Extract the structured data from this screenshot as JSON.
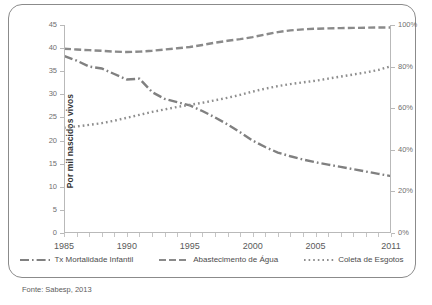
{
  "chart_data": {
    "type": "line",
    "title": "",
    "xlabel": "",
    "ylabel": "Por mil nascidos vivos",
    "y2label": "",
    "x": [
      1985,
      1986,
      1987,
      1988,
      1989,
      1990,
      1991,
      1992,
      1993,
      1994,
      1995,
      1996,
      1997,
      1998,
      1999,
      2000,
      2001,
      2002,
      2003,
      2004,
      2005,
      2006,
      2007,
      2008,
      2009,
      2010,
      2011
    ],
    "xlim": [
      1985,
      2011
    ],
    "ylim": [
      0,
      45
    ],
    "y2lim": [
      0,
      100
    ],
    "yticks": [
      0,
      5,
      10,
      15,
      20,
      25,
      30,
      35,
      40,
      45
    ],
    "y2ticks": [
      "0%",
      "20%",
      "40%",
      "60%",
      "80%",
      "100%"
    ],
    "xticks": [
      1985,
      1990,
      1995,
      2000,
      2005,
      2011
    ],
    "xtick_labels": [
      "1985",
      "1990",
      "1995",
      "2000",
      "2005",
      "2011"
    ],
    "grid": false,
    "legend_position": "bottom",
    "series": [
      {
        "name": "Tx Mortalidade Infantil",
        "axis": "left",
        "style": "dash-dot",
        "color": "#808080",
        "values": [
          38.3,
          37.3,
          36.0,
          35.6,
          34.4,
          33.2,
          33.4,
          30.5,
          29.0,
          28.3,
          27.6,
          26.4,
          25.0,
          23.5,
          21.8,
          20.0,
          18.6,
          17.4,
          16.6,
          15.9,
          15.3,
          14.8,
          14.3,
          13.8,
          13.3,
          12.8,
          12.3
        ]
      },
      {
        "name": "Abastecimento de Água",
        "axis": "right",
        "style": "dashed",
        "color": "#8a8a8a",
        "values": [
          88.6,
          88.2,
          87.9,
          87.6,
          87.2,
          87.0,
          87.2,
          87.6,
          88.2,
          88.8,
          89.4,
          90.4,
          91.5,
          92.4,
          93.2,
          94.2,
          95.4,
          96.6,
          97.4,
          97.9,
          98.2,
          98.4,
          98.5,
          98.6,
          98.7,
          98.8,
          98.8
        ]
      },
      {
        "name": "Coleta de Esgotos",
        "axis": "right",
        "style": "dotted",
        "color": "#8e8e8e",
        "values": [
          50.6,
          51.2,
          52.0,
          52.8,
          54.0,
          55.4,
          56.8,
          58.2,
          59.4,
          60.6,
          61.6,
          62.6,
          63.8,
          65.0,
          66.4,
          68.0,
          69.4,
          70.6,
          71.6,
          72.4,
          73.2,
          74.2,
          75.2,
          76.2,
          77.2,
          78.4,
          80.2
        ]
      }
    ]
  },
  "axis": {
    "left_title": "Por mil nascidos vivos"
  },
  "legend": {
    "items": [
      {
        "label": "Tx Mortalidade Infantil"
      },
      {
        "label": "Abastecimento de Água"
      },
      {
        "label": "Coleta de Esgotos"
      }
    ]
  },
  "source": {
    "text": "Fonte: Sabesp, 2013"
  }
}
